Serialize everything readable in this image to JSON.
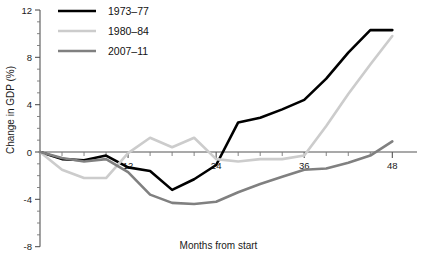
{
  "chart_data": {
    "type": "line",
    "title": "",
    "xlabel": "Months from start",
    "ylabel": "Change in GDP (%)",
    "xlim": [
      0,
      50
    ],
    "ylim": [
      -8,
      12
    ],
    "xticks": [
      0,
      3,
      6,
      9,
      12,
      15,
      18,
      21,
      24,
      27,
      30,
      33,
      36,
      39,
      42,
      45,
      48
    ],
    "xtick_labels": [
      "",
      "",
      "",
      "",
      "12",
      "",
      "",
      "",
      "24",
      "",
      "",
      "",
      "36",
      "",
      "",
      "",
      "48"
    ],
    "yticks": [
      -8,
      -4,
      0,
      4,
      8,
      12
    ],
    "ytick_labels": [
      "-8",
      "-4",
      "0",
      "4",
      "8",
      "12"
    ],
    "y_minor_step": 1,
    "grid": false,
    "legend_position": "top-left",
    "zero_line": true,
    "series": [
      {
        "name": "1973–77",
        "color": "#000000",
        "width": 2.6,
        "x": [
          0,
          3,
          6,
          9,
          12,
          15,
          18,
          21,
          24,
          27,
          30,
          33,
          36,
          39,
          42,
          45,
          48
        ],
        "values": [
          0,
          -0.6,
          -0.7,
          -0.3,
          -1.3,
          -1.6,
          -3.2,
          -2.3,
          -1.1,
          2.5,
          2.9,
          3.6,
          4.4,
          6.2,
          8.4,
          10.3,
          10.3
        ]
      },
      {
        "name": "1980–84",
        "color": "#cccccc",
        "width": 2.6,
        "x": [
          0,
          3,
          6,
          9,
          12,
          15,
          18,
          21,
          24,
          27,
          30,
          33,
          36,
          39,
          42,
          45,
          48
        ],
        "values": [
          0,
          -1.5,
          -2.2,
          -2.2,
          -0.1,
          1.2,
          0.4,
          1.2,
          -0.6,
          -0.8,
          -0.6,
          -0.6,
          -0.3,
          2.2,
          4.9,
          7.4,
          9.8
        ]
      },
      {
        "name": "2007–11",
        "color": "#808080",
        "width": 2.6,
        "x": [
          0,
          3,
          6,
          9,
          12,
          15,
          18,
          21,
          24,
          27,
          30,
          33,
          36,
          39,
          42,
          45,
          48
        ],
        "values": [
          0,
          -0.5,
          -0.8,
          -0.6,
          -1.7,
          -3.6,
          -4.3,
          -4.4,
          -4.2,
          -3.4,
          -2.7,
          -2.1,
          -1.5,
          -1.4,
          -0.9,
          -0.3,
          0.9
        ]
      }
    ]
  },
  "legend": {
    "items": [
      {
        "label": "1973–77"
      },
      {
        "label": "1980–84"
      },
      {
        "label": "2007–11"
      }
    ]
  }
}
